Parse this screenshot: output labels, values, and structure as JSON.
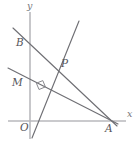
{
  "figure": {
    "width": 138,
    "height": 143,
    "background_color": "#ffffff",
    "line_color": "#6f6f74",
    "axis_color": "#b9b9bd",
    "label_color": "#55555a"
  },
  "axes": {
    "x_axis_label": "x",
    "y_axis_label": "y",
    "origin_label": "O",
    "origin_px": {
      "x": 30,
      "y": 121
    },
    "x_axis": {
      "x1": 8,
      "y1": 121,
      "x2": 126,
      "y2": 121
    },
    "y_axis": {
      "x1": 30,
      "y1": 12,
      "x2": 30,
      "y2": 139
    }
  },
  "points": [
    {
      "name": "O",
      "label": "O",
      "px": {
        "x": 30,
        "y": 121
      },
      "label_px": {
        "x": 20,
        "y": 122
      }
    },
    {
      "name": "A",
      "label": "A",
      "px": {
        "x": 110,
        "y": 121
      },
      "label_px": {
        "x": 106,
        "y": 123
      }
    },
    {
      "name": "B",
      "label": "B",
      "px": {
        "x": 30,
        "y": 45
      },
      "label_px": {
        "x": 17,
        "y": 37
      }
    },
    {
      "name": "M",
      "label": "M",
      "px": {
        "x": 30,
        "y": 85
      },
      "label_px": {
        "x": 14,
        "y": 77
      }
    },
    {
      "name": "P",
      "label": "P",
      "px": {
        "x": 57,
        "y": 65
      },
      "label_px": {
        "x": 61,
        "y": 58
      }
    }
  ],
  "segments": [
    {
      "name": "line-BA",
      "from": "B",
      "to": "A",
      "x1": 13,
      "y1": 28,
      "x2": 117,
      "y2": 126
    },
    {
      "name": "line-MA",
      "from": "M",
      "to": "A",
      "x1": 8,
      "y1": 68,
      "x2": 118,
      "y2": 124
    },
    {
      "name": "line-OP",
      "from": "O",
      "to": "P",
      "x1": 32,
      "y1": 138,
      "x2": 79,
      "y2": 21
    }
  ],
  "annotations": [
    {
      "name": "right-angle-marker",
      "at_px": {
        "x": 41,
        "y": 87
      },
      "meaning": "perpendicular"
    }
  ]
}
